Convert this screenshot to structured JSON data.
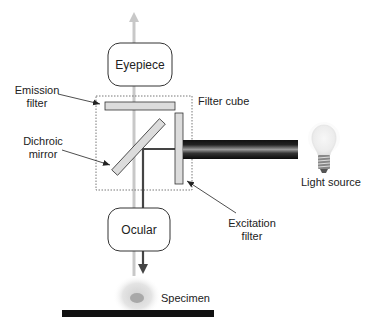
{
  "diagram": {
    "type": "fluorescence-microscope-schematic",
    "components": {
      "eyepiece": {
        "label": "Eyepiece"
      },
      "ocular": {
        "label": "Ocular"
      },
      "filter_cube": {
        "label": "Filter cube"
      },
      "emission_filter": {
        "label_line1": "Emission",
        "label_line2": "filter"
      },
      "dichroic_mirror": {
        "label_line1": "Dichroic",
        "label_line2": "mirror"
      },
      "excitation_filter": {
        "label_line1": "Excitation",
        "label_line2": "filter"
      },
      "light_source": {
        "label": "Light source"
      },
      "specimen": {
        "label": "Specimen"
      }
    },
    "colors": {
      "observation_path": "#c8c8c8",
      "excitation_path": "#444444",
      "filter_fill": "#dcdcdc",
      "outline": "#333333",
      "slide": "#111111"
    }
  }
}
